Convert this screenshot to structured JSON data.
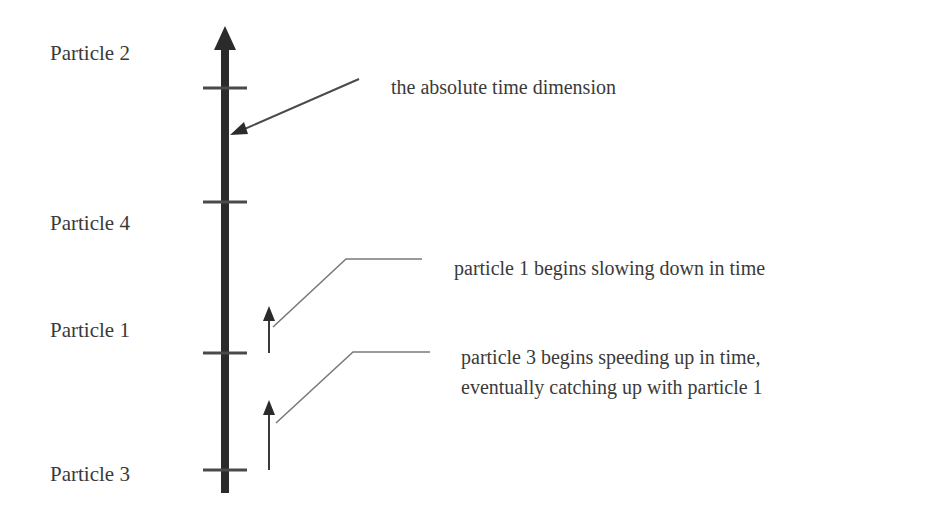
{
  "diagram": {
    "title": "",
    "axis_label": "the absolute time dimension",
    "particles": [
      {
        "label": "Particle 2",
        "tick_y": 88
      },
      {
        "label": "Particle 4",
        "tick_y": 202
      },
      {
        "label": "Particle 1",
        "tick_y": 353
      },
      {
        "label": "Particle 3",
        "tick_y": 470
      }
    ],
    "annotations": [
      {
        "text": "particle 1 begins slowing down in time"
      },
      {
        "line1": "particle 3 begins speeding up in time,",
        "line2": "eventually catching up with particle 1"
      }
    ],
    "colors": {
      "axis": "#2b2b2b",
      "lines": "#6e6e6e",
      "text": "#3a3a3a",
      "background": "#ffffff"
    }
  }
}
